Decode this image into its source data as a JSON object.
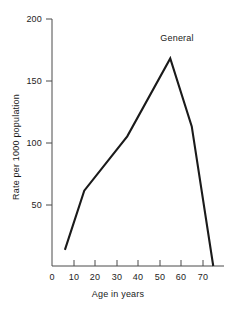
{
  "chart_data": {
    "type": "line",
    "title": "",
    "subtitle": "",
    "xlabel": "Age in years",
    "ylabel": "Rate per 1000 population",
    "xlim": [
      0,
      80
    ],
    "ylim": [
      0,
      200
    ],
    "xticks": [
      0,
      10,
      20,
      30,
      40,
      50,
      60,
      70
    ],
    "yticks": [
      0,
      50,
      100,
      150,
      200
    ],
    "grid": false,
    "legend": null,
    "annotations": [
      {
        "text": "General",
        "x": 55,
        "y": 190
      }
    ],
    "series": [
      {
        "name": "General",
        "color": "#1a1a1a",
        "x": [
          6,
          15,
          35,
          55,
          65,
          75
        ],
        "values": [
          13,
          61,
          105,
          168,
          113,
          0
        ]
      }
    ]
  },
  "axes": {
    "x_tick_labels": [
      "0",
      "10",
      "20",
      "30",
      "40",
      "50",
      "60",
      "70"
    ],
    "y_tick_labels": [
      "0",
      "50",
      "100",
      "150",
      "200"
    ],
    "x_title": "Age in years",
    "y_title": "Rate per 1000 population"
  },
  "annotation": {
    "general_label": "General"
  }
}
